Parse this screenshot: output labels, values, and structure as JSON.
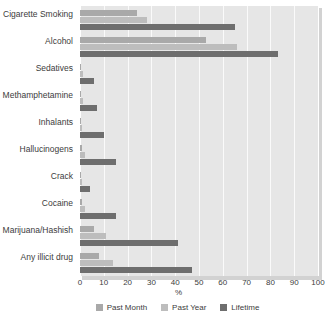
{
  "chart_data": {
    "type": "bar",
    "orientation": "horizontal",
    "title": "",
    "xlabel": "%",
    "ylabel": "",
    "xlim": [
      0,
      100
    ],
    "xticks": [
      0,
      10,
      20,
      30,
      40,
      50,
      60,
      70,
      80,
      90,
      100
    ],
    "grid": true,
    "legend_position": "bottom",
    "categories": [
      "Cigarette Smoking",
      "Alcohol",
      "Sedatives",
      "Methamphetamine",
      "Inhalants",
      "Hallucinogens",
      "Crack",
      "Cocaine",
      "Marijuana/Hashish",
      "Any illicit drug"
    ],
    "series": [
      {
        "name": "Past Month",
        "color": "#a9a9a9",
        "values": [
          24,
          53,
          0.5,
          0.6,
          0.4,
          0.7,
          0.3,
          0.8,
          6,
          8
        ]
      },
      {
        "name": "Past Year",
        "color": "#bdbdbd",
        "values": [
          28,
          66,
          1.2,
          1.4,
          1.0,
          2.0,
          0.8,
          2.0,
          11,
          14
        ]
      },
      {
        "name": "Lifetime",
        "color": "#6e6e6e",
        "values": [
          65,
          83,
          6,
          7,
          10,
          15,
          4,
          15,
          41,
          47
        ]
      }
    ]
  },
  "legend": {
    "items": [
      {
        "label": "Past Month",
        "color": "#a9a9a9"
      },
      {
        "label": "Past Year",
        "color": "#bdbdbd"
      },
      {
        "label": "Lifetime",
        "color": "#6e6e6e"
      }
    ]
  },
  "axis": {
    "x_title": "%"
  },
  "colors": {
    "plot_background": "#e6e6e6",
    "gridline": "#fafafa",
    "text": "#3c3c3c"
  }
}
